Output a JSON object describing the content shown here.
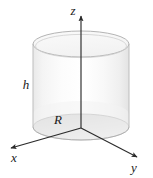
{
  "figure": {
    "canvas": {
      "width": 153,
      "height": 178,
      "background": "#ffffff"
    },
    "colors": {
      "axis": "#2b2b2b",
      "outline": "#b9b9b9",
      "top_face": "#f7f7f7",
      "body_light": "#fdfdfd",
      "body_shade": "#ededed",
      "base_disc": "#dcdcdc",
      "label": "#1a1a1a"
    }
  },
  "labels": {
    "z_axis": {
      "text": "z",
      "x": 73,
      "y": 12,
      "size": 13
    },
    "x_axis": {
      "text": "x",
      "x": 14,
      "y": 159,
      "size": 13
    },
    "y_axis": {
      "text": "y",
      "x": 134,
      "y": 169,
      "size": 13
    },
    "height": {
      "text": "h",
      "x": 26,
      "y": 86,
      "size": 13
    },
    "radius": {
      "text": "R",
      "x": 58,
      "y": 121,
      "size": 13
    }
  },
  "geometry": {
    "origin": {
      "x": 81,
      "y": 128
    },
    "cylinder": {
      "radius_x": 48,
      "radius_y": 13,
      "top_center": {
        "x": 81,
        "y": 44
      },
      "bottom_center": {
        "x": 81,
        "y": 127
      },
      "height_px": 83
    },
    "axes": [
      {
        "name": "z",
        "from": {
          "x": 81,
          "y": 128
        },
        "to": {
          "x": 81,
          "y": 13
        }
      },
      {
        "name": "x",
        "from": {
          "x": 81,
          "y": 128
        },
        "to": {
          "x": 8,
          "y": 149
        }
      },
      {
        "name": "y",
        "from": {
          "x": 81,
          "y": 128
        },
        "to": {
          "x": 140,
          "y": 159
        }
      }
    ]
  }
}
